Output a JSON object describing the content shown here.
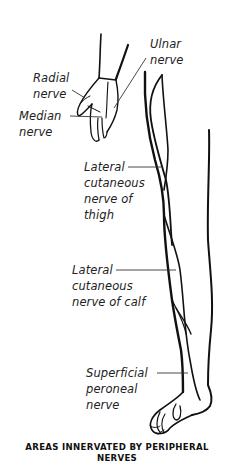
{
  "labels": {
    "ulnar": [
      "Ulnar",
      "nerve"
    ],
    "radial": [
      "Radial",
      "nerve"
    ],
    "median": [
      "Median",
      "nerve"
    ],
    "lateral_thigh": [
      "Lateral",
      "cutaneous",
      "nerve of",
      "thigh"
    ],
    "lateral_calf": [
      "Lateral",
      "cutaneous",
      "nerve of calf"
    ],
    "superficial_peroneal": [
      "Superficial",
      "peroneal",
      "nerve"
    ]
  },
  "caption": [
    "AREAS INNERVATED BY PERIPHERAL",
    "NERVES"
  ],
  "colors": {
    "line": "#111111",
    "leader": "#333333",
    "background": "#ffffff"
  }
}
